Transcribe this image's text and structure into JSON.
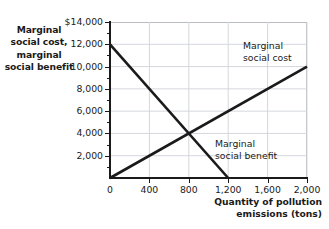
{
  "chart_data": {
    "type": "line",
    "title": "",
    "ylabel": "Marginal social cost, marginal social benefit",
    "xlabel": "Quantity of pollution emissions (tons)",
    "xlim": [
      0,
      2000
    ],
    "ylim": [
      0,
      14000
    ],
    "grid": true,
    "legend_position": "inline-annotations",
    "x_ticks": [
      {
        "value": 0,
        "label": "0"
      },
      {
        "value": 400,
        "label": "400"
      },
      {
        "value": 800,
        "label": "800"
      },
      {
        "value": 1200,
        "label": "1,200"
      },
      {
        "value": 1600,
        "label": "1,600"
      },
      {
        "value": 2000,
        "label": "2,000"
      }
    ],
    "y_ticks": [
      {
        "value": 2000,
        "label": "2,000"
      },
      {
        "value": 4000,
        "label": "4,000"
      },
      {
        "value": 6000,
        "label": "6,000"
      },
      {
        "value": 8000,
        "label": "8,000"
      },
      {
        "value": 10000,
        "label": "10,000"
      },
      {
        "value": 12000,
        "label": "12,000"
      },
      {
        "value": 14000,
        "label": "$14,000"
      }
    ],
    "y_minor_ticks": [
      1000,
      3000,
      5000,
      7000,
      9000,
      11000,
      13000
    ],
    "series": [
      {
        "name": "Marginal social cost",
        "points": [
          [
            0,
            0
          ],
          [
            2000,
            10000
          ]
        ],
        "color": "#1a1a1a"
      },
      {
        "name": "Marginal social benefit",
        "points": [
          [
            0,
            12000
          ],
          [
            1200,
            0
          ]
        ],
        "color": "#1a1a1a"
      }
    ],
    "intersection": {
      "x": 800,
      "y": 4000
    }
  },
  "annotations": {
    "y_axis_title_lines": [
      "Marginal",
      "social cost,",
      "marginal",
      "social benefit"
    ],
    "x_axis_title_lines": [
      "Quantity of pollution",
      "emissions (tons)"
    ],
    "msc_label_lines": [
      "Marginal",
      "social cost"
    ],
    "msb_label_lines": [
      "Marginal",
      "social benefit"
    ]
  },
  "colors": {
    "line": "#1a1a1a",
    "grid": "#d5d7dd",
    "axis": "#1a1a1a",
    "background": "#ffffff"
  }
}
